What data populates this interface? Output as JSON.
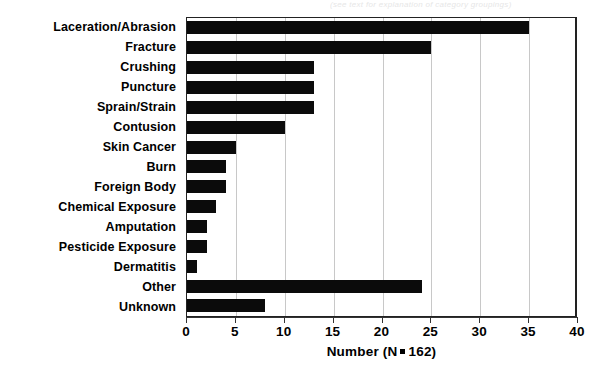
{
  "artifact_text": "(see text for explanation of category groupings)",
  "chart_data": {
    "type": "bar",
    "orientation": "horizontal",
    "title": "",
    "subtitle": "",
    "xlabel": "Number (N = 162)",
    "ylabel": "",
    "categories": [
      "Laceration/Abrasion",
      "Fracture",
      "Crushing",
      "Puncture",
      "Sprain/Strain",
      "Contusion",
      "Skin Cancer",
      "Burn",
      "Foreign Body",
      "Chemical Exposure",
      "Amputation",
      "Pesticide Exposure",
      "Dermatitis",
      "Other",
      "Unknown"
    ],
    "values": [
      35,
      25,
      13,
      13,
      13,
      10,
      5,
      4,
      4,
      3,
      2,
      2,
      1,
      24,
      8
    ],
    "xlim": [
      0,
      40
    ],
    "xticks": [
      0,
      5,
      10,
      15,
      20,
      25,
      30,
      35,
      40
    ],
    "xtick_labels": [
      "0",
      "5",
      "10",
      "15",
      "20",
      "25",
      "30",
      "35",
      "40"
    ],
    "grid": "vertical",
    "legend": "none",
    "bar_color": "#0b0b0b",
    "total_n": 162
  },
  "axis": {
    "title_prefix": "Number (N",
    "title_suffix": "162)"
  }
}
